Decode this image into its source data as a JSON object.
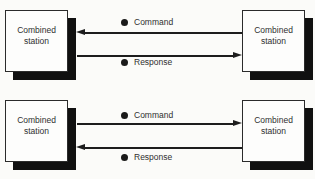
{
  "links": [
    {
      "left_station": {
        "label": "Combined station"
      },
      "right_station": {
        "label": "Combined station"
      },
      "arrows": [
        {
          "label": "Command",
          "direction": "right-to-left"
        },
        {
          "label": "Response",
          "direction": "left-to-right"
        }
      ]
    },
    {
      "left_station": {
        "label": "Combined station"
      },
      "right_station": {
        "label": "Combined station"
      },
      "arrows": [
        {
          "label": "Command",
          "direction": "left-to-right"
        },
        {
          "label": "Response",
          "direction": "right-to-left"
        }
      ]
    }
  ],
  "icons": {
    "bullet": "filled-circle",
    "arrowhead": "solid-triangle"
  },
  "colors": {
    "background": "#fbfbf9",
    "box_fill": "#fdfdfc",
    "box_border": "#2b2b2b",
    "box_shadow": "#101010",
    "line": "#1d1d1d",
    "text": "#2f2f2f"
  }
}
